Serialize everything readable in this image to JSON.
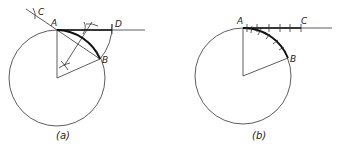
{
  "figure_a": {
    "caption": "(a)",
    "labels": {
      "A": "A",
      "B": "B",
      "C": "C",
      "D": "D"
    },
    "description": "Construction: chord AB bisected, arc swung from A to find D on tangent line; tangent length AD approximates arc AB"
  },
  "figure_b": {
    "caption": "(b)",
    "labels": {
      "A": "A",
      "B": "B",
      "C": "C"
    },
    "description": "Arc AB stepped off in small equal divisions, transferred onto tangent line from A to C"
  },
  "colors": {
    "line": "#333333",
    "bold": "#111111",
    "background": "#ffffff"
  }
}
